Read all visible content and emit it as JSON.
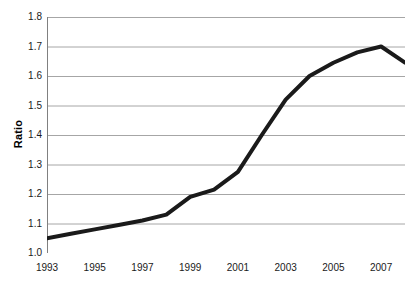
{
  "chart_data": {
    "type": "line",
    "title": "",
    "xlabel": "",
    "ylabel": "Ratio",
    "x": [
      1993,
      1994,
      1995,
      1996,
      1997,
      1998,
      1999,
      2000,
      2001,
      2002,
      2003,
      2004,
      2005,
      2006,
      2007,
      2008
    ],
    "values": [
      1.05,
      1.065,
      1.08,
      1.095,
      1.11,
      1.13,
      1.19,
      1.215,
      1.275,
      1.4,
      1.52,
      1.6,
      1.645,
      1.68,
      1.7,
      1.645
    ],
    "series": [
      {
        "name": "Ratio",
        "values": [
          1.05,
          1.065,
          1.08,
          1.095,
          1.11,
          1.13,
          1.19,
          1.215,
          1.275,
          1.4,
          1.52,
          1.6,
          1.645,
          1.68,
          1.7,
          1.645
        ]
      }
    ],
    "xlim": [
      1993,
      2008
    ],
    "ylim": [
      1.0,
      1.8
    ],
    "y_ticks": [
      1.0,
      1.1,
      1.2,
      1.3,
      1.4,
      1.5,
      1.6,
      1.7,
      1.8
    ],
    "y_tick_labels": [
      "1.0",
      "1.1",
      "1.2",
      "1.3",
      "1.4",
      "1.5",
      "1.6",
      "1.7",
      "1.8"
    ],
    "x_ticks": [
      1993,
      1994,
      1995,
      1996,
      1997,
      1998,
      1999,
      2000,
      2001,
      2002,
      2003,
      2004,
      2005,
      2006,
      2007,
      2008
    ],
    "x_tick_labels": [
      "1993",
      "",
      "1995",
      "",
      "1997",
      "",
      "1999",
      "",
      "2001",
      "",
      "2003",
      "",
      "2005",
      "",
      "2007",
      ""
    ],
    "grid": "horizontal",
    "legend": "none",
    "line_color": "#1a1a1a",
    "line_width": 4,
    "grid_color": "#a6a6a6",
    "axis_color": "#808080",
    "background": "#ffffff"
  }
}
